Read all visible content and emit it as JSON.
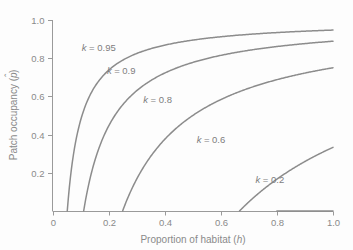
{
  "chart_data": {
    "type": "line",
    "title": "",
    "xlabel": "Proportion of habitat (h)",
    "ylabel": "Patch occupancy (p)",
    "xlabel_main": "Proportion of habitat",
    "xlabel_var": "h",
    "ylabel_main": "Patch occupancy",
    "ylabel_var": "p",
    "xlim": [
      0,
      1.0
    ],
    "ylim": [
      0,
      1.0
    ],
    "xticks": [
      0,
      0.2,
      0.4,
      0.6,
      0.8,
      1.0
    ],
    "xticklabels": [
      "0",
      "0.2",
      "0.4",
      "0.6",
      "0.8",
      "1.0"
    ],
    "yticks": [
      0.2,
      0.4,
      0.6,
      0.8,
      1.0
    ],
    "yticklabels": [
      "0.2",
      "0.4",
      "0.6",
      "0.8",
      "1.0"
    ],
    "grid": false,
    "legend_position": "inline-annotations",
    "line_color": "#8c8c8c",
    "axis_color": "#9a9a9a",
    "text_color": "#8a8a8a",
    "background_color": "#fdfdfd",
    "equation": "p = 1 - (1 - k) / (k * h)",
    "series": [
      {
        "name": "k = 0.95",
        "k": 0.95,
        "label_text": "k = 0.95",
        "label_k": "k",
        "label_value": "= 0.95",
        "x_intercept": 0.0526,
        "x": [
          0.0526,
          0.06,
          0.07,
          0.08,
          0.09,
          0.1,
          0.12,
          0.15,
          0.2,
          0.25,
          0.3,
          0.4,
          0.5,
          0.6,
          0.7,
          0.8,
          0.9,
          1.0
        ],
        "values": [
          0.0,
          0.123,
          0.248,
          0.342,
          0.415,
          0.474,
          0.561,
          0.649,
          0.737,
          0.789,
          0.825,
          0.868,
          0.895,
          0.912,
          0.925,
          0.934,
          0.942,
          0.947
        ]
      },
      {
        "name": "k = 0.9",
        "k": 0.9,
        "label_text": "k = 0.9",
        "label_k": "k",
        "label_value": "= 0.9",
        "x_intercept": 0.1111,
        "x": [
          0.1111,
          0.12,
          0.13,
          0.15,
          0.17,
          0.2,
          0.25,
          0.3,
          0.35,
          0.4,
          0.5,
          0.6,
          0.7,
          0.8,
          0.9,
          1.0
        ],
        "values": [
          0.0,
          0.074,
          0.145,
          0.259,
          0.346,
          0.444,
          0.556,
          0.63,
          0.683,
          0.722,
          0.778,
          0.815,
          0.841,
          0.861,
          0.877,
          0.889
        ]
      },
      {
        "name": "k = 0.8",
        "k": 0.8,
        "label_text": "k = 0.8",
        "label_k": "k",
        "label_value": "= 0.8",
        "x_intercept": 0.25,
        "x": [
          0.25,
          0.27,
          0.3,
          0.33,
          0.36,
          0.4,
          0.45,
          0.5,
          0.55,
          0.6,
          0.65,
          0.7,
          0.8,
          0.9,
          1.0
        ],
        "values": [
          0.0,
          0.074,
          0.167,
          0.242,
          0.306,
          0.375,
          0.444,
          0.5,
          0.545,
          0.583,
          0.615,
          0.643,
          0.688,
          0.722,
          0.75
        ]
      },
      {
        "name": "k = 0.6",
        "k": 0.6,
        "label_text": "k = 0.6",
        "label_k": "k",
        "label_value": "= 0.6",
        "x_intercept": 0.6667,
        "x": [
          0.6667,
          0.69,
          0.72,
          0.75,
          0.78,
          0.82,
          0.86,
          0.9,
          0.95,
          1.0
        ],
        "values": [
          0.0,
          0.034,
          0.074,
          0.111,
          0.145,
          0.187,
          0.225,
          0.259,
          0.298,
          0.333
        ]
      },
      {
        "name": "k = 0.2",
        "k": 0.2,
        "label_text": "k = 0.2",
        "label_k": "k",
        "label_value": "= 0.2",
        "x_intercept": 0.8,
        "x": [
          0.8,
          0.82,
          0.85,
          0.88,
          0.91,
          0.94,
          0.97,
          1.0
        ],
        "values": [
          0.0,
          0.0244,
          0.0588,
          0.0909,
          0.1209,
          0.1489,
          0.1753,
          0.2
        ]
      }
    ],
    "annotations": [
      {
        "text": "k = 0.95",
        "x": 0.165,
        "y": 0.855
      },
      {
        "text": "k = 0.9",
        "x": 0.245,
        "y": 0.735
      },
      {
        "text": "k = 0.8",
        "x": 0.375,
        "y": 0.585
      },
      {
        "text": "k = 0.6",
        "x": 0.565,
        "y": 0.375
      },
      {
        "text": "k = 0.2",
        "x": 0.775,
        "y": 0.165
      }
    ]
  }
}
